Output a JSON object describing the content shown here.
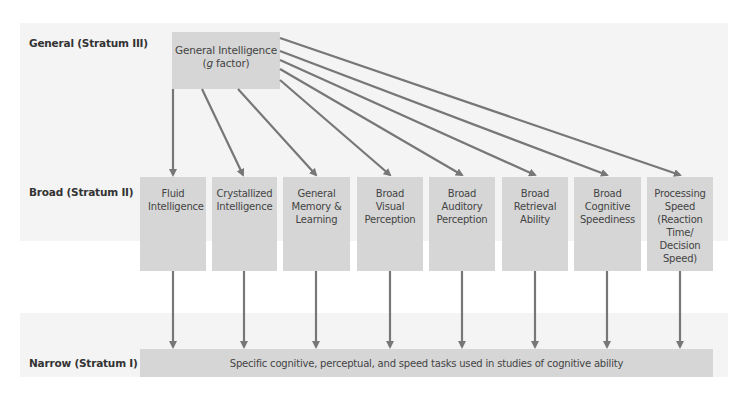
{
  "strata": {
    "general_label": "General (Stratum III)",
    "broad_label": "Broad (Stratum II)",
    "narrow_label": "Narrow (Stratum I)"
  },
  "general_box": {
    "line1": "General Intelligence",
    "line2_italic": "g",
    "line2_rest": " factor)",
    "line2_open": "("
  },
  "broad_abilities": [
    {
      "label": "Fluid Intelligence"
    },
    {
      "label": "Crystallized Intelligence"
    },
    {
      "label": "General Memory & Learning"
    },
    {
      "label": "Broad Visual Perception"
    },
    {
      "label": "Broad Auditory Perception"
    },
    {
      "label": "Broad Retrieval Ability"
    },
    {
      "label": "Broad Cognitive Speediness"
    },
    {
      "label": "Processing Speed (Reaction Time/ Decision Speed)"
    }
  ],
  "narrow_box": {
    "text": "Specific cognitive, perceptual, and speed tasks used in studies of cognitive ability"
  },
  "colors": {
    "band": "#f4f4f4",
    "box": "#d6d6d6",
    "arrow": "#777777"
  }
}
